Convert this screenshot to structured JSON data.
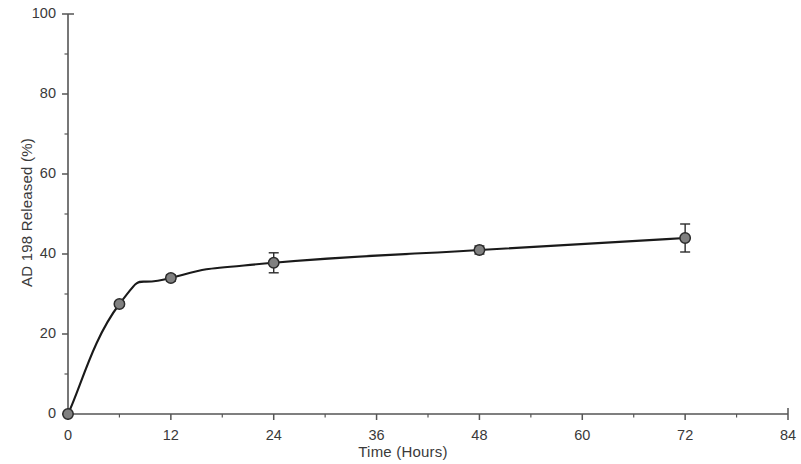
{
  "chart_data": {
    "type": "line",
    "title": "",
    "xlabel": "Time (Hours)",
    "ylabel": "AD 198 Released (%)",
    "xlim": [
      0,
      84
    ],
    "ylim": [
      0,
      100
    ],
    "xticks": [
      0,
      12,
      24,
      36,
      48,
      60,
      72,
      84
    ],
    "xtick_labels": [
      "0",
      "12",
      "24",
      "36",
      "48",
      "60",
      "72",
      "84"
    ],
    "yticks": [
      0,
      20,
      40,
      60,
      80,
      100
    ],
    "ytick_labels": [
      "0",
      "20",
      "40",
      "60",
      "80",
      "100"
    ],
    "x_minor_interval": 6,
    "y_minor_interval": 10,
    "grid": false,
    "legend": "none",
    "series": [
      {
        "name": "AD 198 Released",
        "marker": "circle",
        "marker_color": "#808080",
        "marker_edge_color": "#2b2b2b",
        "line_color": "#1a1a1a",
        "x": [
          0,
          6,
          12,
          24,
          48,
          72
        ],
        "y": [
          0,
          27.5,
          34,
          37.8,
          41,
          44
        ],
        "yerr": [
          0,
          0.6,
          0.8,
          2.5,
          1.0,
          3.5
        ]
      }
    ]
  },
  "figure": {
    "background_color": "#ffffff",
    "axis_color": "#555555",
    "text_color": "#3a3a3a"
  }
}
